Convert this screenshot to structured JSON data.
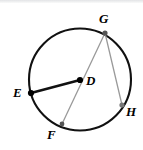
{
  "figure": {
    "kind": "circle-geometry-diagram",
    "background_color": "#ffffff",
    "width": 143,
    "height": 150
  },
  "circle": {
    "name": "circle-D",
    "center_x": 80,
    "center_y": 79.5,
    "radius": 51,
    "stroke_color": "#111111",
    "stroke_width": 2.1,
    "fill": "none"
  },
  "points": [
    {
      "id": "E",
      "label": "E",
      "x": 31,
      "y": 93,
      "on_circle": true,
      "dot": true,
      "dot_radius": 3.1,
      "dot_color": "#000000",
      "label_x": 13,
      "label_y": 86
    },
    {
      "id": "G",
      "label": "G",
      "x": 105,
      "y": 33,
      "on_circle": true,
      "dot": true,
      "dot_radius": 2.6,
      "dot_color": "#555555",
      "label_x": 99,
      "label_y": 12
    },
    {
      "id": "D",
      "label": "D",
      "x": 80,
      "y": 80,
      "on_circle": false,
      "dot": true,
      "dot_radius": 3.1,
      "dot_color": "#000000",
      "label_x": 86,
      "label_y": 74
    },
    {
      "id": "H",
      "label": "H",
      "x": 122,
      "y": 105,
      "on_circle": true,
      "dot": true,
      "dot_radius": 2.6,
      "dot_color": "#777777",
      "label_x": 126,
      "label_y": 105
    },
    {
      "id": "F",
      "label": "F",
      "x": 62,
      "y": 124,
      "on_circle": true,
      "dot": true,
      "dot_radius": 2.4,
      "dot_color": "#555555",
      "label_x": 47,
      "label_y": 128
    }
  ],
  "segments": [
    {
      "id": "ED",
      "label": "E-D radius",
      "from": "E",
      "to": "D",
      "x1": 31,
      "y1": 93,
      "x2": 80,
      "y2": 80,
      "stroke_color": "#111111",
      "stroke_width": 2.6,
      "kind": "radius"
    },
    {
      "id": "GF",
      "label": "G-F chord",
      "from": "G",
      "to": "F",
      "x1": 105,
      "y1": 33,
      "x2": 62,
      "y2": 124,
      "stroke_color": "#9a9a9a",
      "stroke_width": 1.3,
      "kind": "chord"
    },
    {
      "id": "GH",
      "label": "G-H chord",
      "from": "G",
      "to": "H",
      "x1": 105,
      "y1": 33,
      "x2": 122,
      "y2": 105,
      "stroke_color": "#9a9a9a",
      "stroke_width": 1.3,
      "kind": "chord"
    }
  ],
  "decor": {
    "top_band_color": "#e3e4e6"
  }
}
